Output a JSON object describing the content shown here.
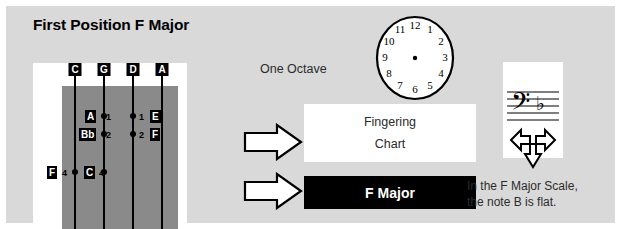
{
  "page": {
    "title": "First Position F Major",
    "card_bg": "#d9d9d9",
    "page_bg": "#ffffff"
  },
  "fingerboard": {
    "name": "cello-fingerboard-diagram",
    "board_color": "#8a8a8a",
    "panel_color": "#ffffff",
    "strings": [
      {
        "label": "C",
        "x": 42
      },
      {
        "label": "G",
        "x": 71
      },
      {
        "label": "D",
        "x": 100
      },
      {
        "label": "A",
        "x": 129
      }
    ],
    "notes": [
      {
        "label": "A",
        "string": "G",
        "finger": "1",
        "chip_x": 52,
        "chip_y": 47,
        "num_x": 73,
        "num_y": 49,
        "dot_x": 71,
        "dot_y": 53
      },
      {
        "label": "E",
        "string": "D",
        "finger": "1",
        "chip_x": 117,
        "chip_y": 47,
        "num_x": 106,
        "num_y": 49,
        "dot_x": 100,
        "dot_y": 53
      },
      {
        "label": "Bb",
        "string": "G",
        "finger": "2",
        "chip_x": 46,
        "chip_y": 65,
        "num_x": 73,
        "num_y": 67,
        "dot_x": 71,
        "dot_y": 71
      },
      {
        "label": "F",
        "string": "D",
        "finger": "2",
        "chip_x": 117,
        "chip_y": 65,
        "num_x": 106,
        "num_y": 67,
        "dot_x": 100,
        "dot_y": 71
      },
      {
        "label": "F",
        "string": "C",
        "finger": "4",
        "chip_x": 14,
        "chip_y": 103,
        "num_x": 29,
        "num_y": 105,
        "dot_x": 42,
        "dot_y": 109
      },
      {
        "label": "C",
        "string": "G",
        "finger": "4",
        "chip_x": 51,
        "chip_y": 103,
        "num_x": 66,
        "num_y": 105,
        "dot_x": 71,
        "dot_y": 109
      }
    ]
  },
  "labels": {
    "one_octave": "One Octave"
  },
  "clock": {
    "name": "clock-face",
    "numerals": [
      "12",
      "1",
      "2",
      "3",
      "4",
      "5",
      "6",
      "7",
      "8",
      "9",
      "10",
      "11"
    ],
    "has_hands": false,
    "center_dot": true
  },
  "fingering_chart": {
    "line1": "Fingering",
    "line2": "Chart"
  },
  "key_box": {
    "label": "F Major",
    "bg": "#000000",
    "fg": "#ffffff"
  },
  "staff": {
    "name": "bass-clef-staff",
    "clef": "bass-clef",
    "key_signature": [
      "B-flat"
    ],
    "lines": 5
  },
  "scale_note": {
    "line1": "In the F Major Scale,",
    "line2": "the note B is flat."
  },
  "arrows": {
    "fingering_arrow": "arrow-right",
    "fmajor_arrow": "arrow-right",
    "tri_arrow": "arrow-left-right-down"
  }
}
